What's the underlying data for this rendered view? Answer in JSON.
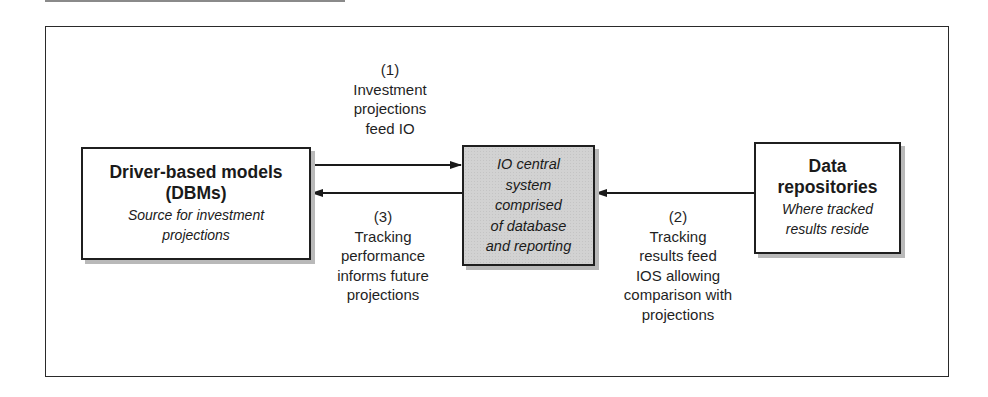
{
  "diagram": {
    "nodes": [
      {
        "id": "dbm",
        "title": "Driver-based models (DBMs)",
        "title_line1": "Driver-based models",
        "title_line2": "(DBMs)",
        "subtitle_line1": "Source for investment",
        "subtitle_line2": "projections",
        "fill": "#ffffff"
      },
      {
        "id": "io",
        "lines": [
          "IO central",
          "system",
          "comprised",
          "of database",
          "and reporting"
        ],
        "fill": "#d2d2d2"
      },
      {
        "id": "data",
        "title_line1": "Data",
        "title_line2": "repositories",
        "subtitle_line1": "Where tracked",
        "subtitle_line2": "results reside",
        "fill": "#ffffff"
      }
    ],
    "edges": [
      {
        "id": "1",
        "from": "dbm",
        "to": "io",
        "lines": [
          "(1)",
          "Investment",
          "projections",
          "feed IO"
        ]
      },
      {
        "id": "2",
        "from": "data",
        "to": "io",
        "lines": [
          "(2)",
          "Tracking",
          "results feed",
          "IOS allowing",
          "comparison with",
          "projections"
        ]
      },
      {
        "id": "3",
        "from": "io",
        "to": "dbm",
        "lines": [
          "(3)",
          "Tracking",
          "performance",
          "informs future",
          "projections"
        ]
      }
    ]
  }
}
